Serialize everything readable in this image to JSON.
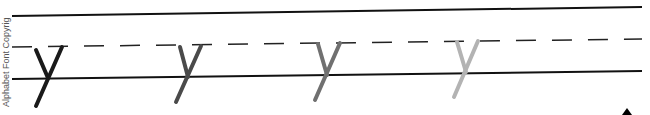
{
  "worksheet": {
    "side_label": "Alphabet Font Copyrig",
    "letter": "y",
    "letter_colors": [
      "#1a1a1a",
      "#4a4a4a",
      "#7a7a7a",
      "#b3b3b3"
    ],
    "line_color": "#111111"
  }
}
